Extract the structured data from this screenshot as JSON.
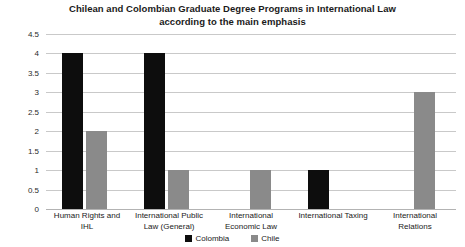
{
  "chart_data": {
    "type": "bar",
    "title": "Chilean and Colombian Graduate Degree Programs in International Law according to the main emphasis",
    "title_line1": "Chilean and Colombian Graduate Degree Programs in International Law",
    "title_line2": "according to the main emphasis",
    "xlabel": "",
    "ylabel": "",
    "ylim": [
      0,
      4.5
    ],
    "ytick_step": 0.5,
    "yticks": [
      "4.5",
      "4",
      "3.5",
      "3",
      "2.5",
      "2",
      "1.5",
      "1",
      "0.5",
      "0"
    ],
    "ytick_values": [
      4.5,
      4,
      3.5,
      3,
      2.5,
      2,
      1.5,
      1,
      0.5,
      0
    ],
    "grid": true,
    "legend_position": "bottom-center",
    "categories": [
      "Human Rights and IHL",
      "International Public Law (General)",
      "International Economic Law",
      "International Taxing",
      "International Relations"
    ],
    "category_lines": [
      [
        "Human Rights and",
        "IHL"
      ],
      [
        "International Public",
        "Law (General)"
      ],
      [
        "International",
        "Economic Law"
      ],
      [
        "International Taxing",
        ""
      ],
      [
        "International",
        "Relations"
      ]
    ],
    "series": [
      {
        "name": "Colombia",
        "color": "#0d0d0d",
        "values": [
          4,
          4,
          0,
          1,
          0
        ]
      },
      {
        "name": "Chile",
        "color": "#8a8a8a",
        "values": [
          2,
          1,
          1,
          0,
          3
        ]
      }
    ]
  },
  "legend": {
    "items": [
      {
        "label": "Colombia"
      },
      {
        "label": "Chile"
      }
    ]
  }
}
